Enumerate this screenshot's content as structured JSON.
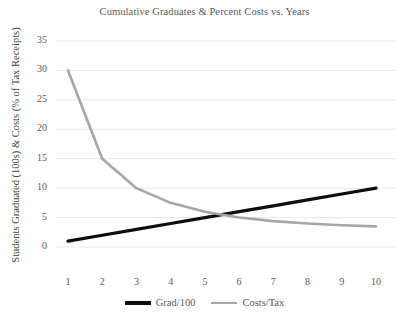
{
  "chart_data": {
    "type": "line",
    "title": "Cumulative Graduates & Percent Costs vs. Years",
    "xlabel": "",
    "ylabel": "Students Graduated (100s) & Costs (% of Tax Receipts)",
    "xlim": [
      1,
      10
    ],
    "ylim": [
      0,
      35
    ],
    "yticks": [
      0,
      5,
      10,
      15,
      20,
      25,
      30,
      35
    ],
    "xticks": [
      1,
      2,
      3,
      4,
      5,
      6,
      7,
      8,
      9,
      10
    ],
    "grid": "horizontal",
    "legend_position": "bottom",
    "x": [
      1,
      2,
      3,
      4,
      5,
      6,
      7,
      8,
      9,
      10
    ],
    "series": [
      {
        "name": "Grad/100",
        "color": "#0d0d0d",
        "width": 3.2,
        "values": [
          1,
          2,
          3,
          4,
          5,
          6,
          7,
          8,
          9,
          10
        ]
      },
      {
        "name": "Costs/Tax",
        "color": "#a6a6a6",
        "width": 2.6,
        "values": [
          30,
          15,
          10,
          7.5,
          6,
          5,
          4.4,
          4,
          3.7,
          3.5
        ]
      }
    ]
  },
  "axes": {
    "y_tick_labels": [
      "35",
      "30",
      "25",
      "20",
      "15",
      "10",
      "5",
      "0"
    ],
    "x_tick_labels": [
      "1",
      "2",
      "3",
      "4",
      "5",
      "6",
      "7",
      "8",
      "9",
      "10"
    ]
  },
  "legend": {
    "entries": [
      {
        "label": "Grad/100"
      },
      {
        "label": "Costs/Tax"
      }
    ]
  },
  "colors": {
    "grad_line": "#0d0d0d",
    "costs_line": "#a6a6a6",
    "gridline": "#e8e8e8",
    "text": "#595959"
  }
}
